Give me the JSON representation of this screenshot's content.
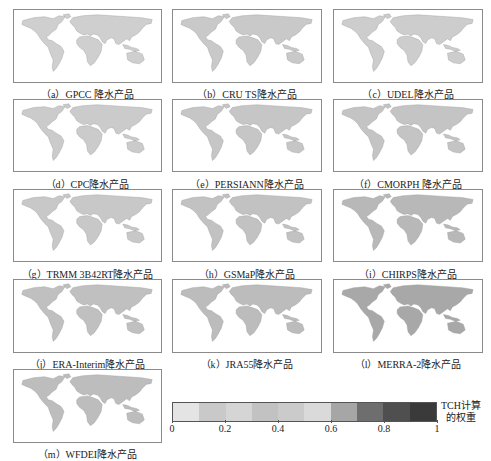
{
  "chart_data": {
    "type": "heatmap",
    "title": "",
    "panels": [
      {
        "id": "a",
        "caption": "（a）GPCC 降水产品",
        "product": "GPCC",
        "shade": "#cfcfcf"
      },
      {
        "id": "b",
        "caption": "（b）CRU TS降水产品",
        "product": "CRU TS",
        "shade": "#c9c9c9"
      },
      {
        "id": "c",
        "caption": "（c）UDEL降水产品",
        "product": "UDEL",
        "shade": "#cdcdcd"
      },
      {
        "id": "d",
        "caption": "（d）CPC降水产品",
        "product": "CPC",
        "shade": "#cbcbcb"
      },
      {
        "id": "e",
        "caption": "（e）PERSIANN降水产品",
        "product": "PERSIANN",
        "shade": "#c6c6c6"
      },
      {
        "id": "f",
        "caption": "（f）CMORPH 降水产品",
        "product": "CMORPH",
        "shade": "#c4c4c4"
      },
      {
        "id": "g",
        "caption": "（g）TRMM 3B42RT降水产品",
        "product": "TRMM 3B42RT",
        "shade": "#c8c8c8"
      },
      {
        "id": "h",
        "caption": "（h）GSMaP降水产品",
        "product": "GSMaP",
        "shade": "#c2c2c2"
      },
      {
        "id": "i",
        "caption": "（i）CHIRPS降水产品",
        "product": "CHIRPS",
        "shade": "#b8b8b8"
      },
      {
        "id": "j",
        "caption": "（j）ERA-Interim降水产品",
        "product": "ERA-Interim",
        "shade": "#c0c0c0"
      },
      {
        "id": "k",
        "caption": "（k）JRA55降水产品",
        "product": "JRA55",
        "shade": "#bcbcbc"
      },
      {
        "id": "l",
        "caption": "（l）MERRA-2降水产品",
        "product": "MERRA-2",
        "shade": "#a8a8a8"
      },
      {
        "id": "m",
        "caption": "（m）WFDEI降水产品",
        "product": "WFDEI",
        "shade": "#bdbdbd"
      }
    ],
    "colorbar": {
      "label_line1": "TCH计算",
      "label_line2": "的权重",
      "range": [
        0,
        1
      ],
      "ticks": [
        "0",
        "0.2",
        "0.4",
        "0.6",
        "0.8",
        "1"
      ],
      "segments": [
        "#e4e4e4",
        "#c9c9c9",
        "#d5d5d5",
        "#c2c2c2",
        "#cbcbcb",
        "#dadada",
        "#a6a6a6",
        "#6e6e6e",
        "#4f4f4f",
        "#3a3a3a"
      ]
    }
  }
}
